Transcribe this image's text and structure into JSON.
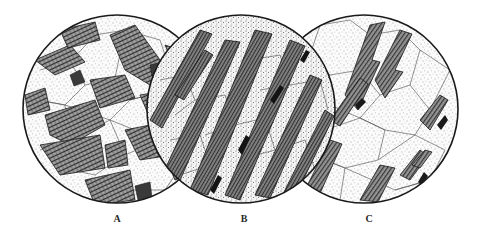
{
  "figure": {
    "background": "#ffffff",
    "ink_color": "#1e1e1e",
    "panels": [
      {
        "id": "A",
        "label": "A",
        "cx": 117,
        "cy": 109,
        "r": 94,
        "texture": "equigranular-blocky",
        "description": "Randomly oriented blocky crystals with cross-hatched cleavage among stippled polygonal grains",
        "label_x": 117
      },
      {
        "id": "B",
        "label": "B",
        "cx": 241,
        "cy": 109,
        "r": 94,
        "texture": "strongly-foliated",
        "description": "Elongated dark crystals strongly aligned diagonally (lower-left to upper-right) in a stippled granular matrix",
        "label_x": 244
      },
      {
        "id": "C",
        "label": "C",
        "cx": 364,
        "cy": 109,
        "r": 94,
        "texture": "weakly-foliated",
        "description": "Scattered elongated crystals with partial diagonal alignment in a coarser stippled polygonal matrix",
        "label_x": 369
      }
    ]
  }
}
